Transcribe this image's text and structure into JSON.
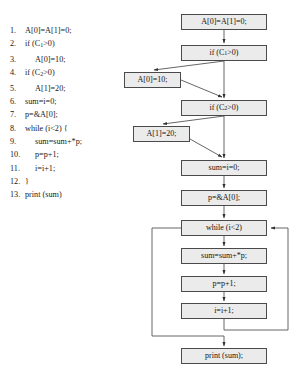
{
  "code_listing": {
    "name": "source-code-listing",
    "lines": [
      {
        "num": "1.",
        "indent": 0,
        "text": "A[0]=A[1]=0;"
      },
      {
        "num": "2.",
        "indent": 0,
        "text": "if (C",
        "sub": "1",
        "text_after": ">0)"
      },
      {
        "num": "3.",
        "indent": 1,
        "text": "A[0]=10;"
      },
      {
        "num": "4.",
        "indent": 0,
        "text": "if (C",
        "sub": "2",
        "text_after": ">0)"
      },
      {
        "num": "5.",
        "indent": 1,
        "text": "A[1]=20;"
      },
      {
        "num": "6.",
        "indent": 0,
        "text": "sum=i=0;"
      },
      {
        "num": "7.",
        "indent": 0,
        "text": "p=&A[0];"
      },
      {
        "num": "8.",
        "indent": 0,
        "text": "while (i<2) {"
      },
      {
        "num": "9.",
        "indent": 1,
        "text": "sum=sum+*p;"
      },
      {
        "num": "10.",
        "indent": 1,
        "text": "p=p+1;"
      },
      {
        "num": "11.",
        "indent": 1,
        "text": "i=i+1;"
      },
      {
        "num": "12.",
        "indent": 0,
        "text": "}"
      },
      {
        "num": "13.",
        "indent": 0,
        "text": "print (sum)"
      }
    ]
  },
  "flow_graph": {
    "name": "control-flow-graph",
    "nodes": [
      {
        "id": "init",
        "label": "A[0]=A[1]=0;",
        "x": 181,
        "y": 14,
        "w": 86,
        "h": 16
      },
      {
        "id": "if_c1",
        "label": "if (C",
        "sub": "1",
        "label_after": ">0)",
        "x": 181,
        "y": 45,
        "w": 86,
        "h": 16
      },
      {
        "id": "a0_10",
        "label": "A[0]=10;",
        "x": 124,
        "y": 72,
        "w": 57,
        "h": 16
      },
      {
        "id": "if_c2",
        "label": "if (C",
        "sub": "2",
        "label_after": ">0)",
        "x": 181,
        "y": 100,
        "w": 86,
        "h": 16
      },
      {
        "id": "a1_20",
        "label": "A[1]=20;",
        "x": 133,
        "y": 126,
        "w": 57,
        "h": 16
      },
      {
        "id": "sum_i_0",
        "label": "sum=i=0;",
        "x": 181,
        "y": 160,
        "w": 86,
        "h": 16
      },
      {
        "id": "p_addr",
        "label": "p=&A[0];",
        "x": 181,
        "y": 190,
        "w": 86,
        "h": 16
      },
      {
        "id": "while_i2",
        "label": "while (i<2)",
        "x": 181,
        "y": 220,
        "w": 86,
        "h": 16
      },
      {
        "id": "sum_add",
        "label": "sum=sum+*p;",
        "x": 181,
        "y": 248,
        "w": 86,
        "h": 16
      },
      {
        "id": "p_inc",
        "label": "p=p+1;",
        "x": 181,
        "y": 276,
        "w": 86,
        "h": 16
      },
      {
        "id": "i_inc",
        "label": "i=i+1;",
        "x": 181,
        "y": 303,
        "w": 86,
        "h": 16
      },
      {
        "id": "print",
        "label": "print (sum);",
        "x": 181,
        "y": 348,
        "w": 86,
        "h": 16
      }
    ],
    "edges": [
      {
        "from": "init",
        "to": "if_c1",
        "kind": "straight-down"
      },
      {
        "from": "if_c1",
        "to": "a0_10",
        "kind": "branch-left"
      },
      {
        "from": "if_c1",
        "to": "if_c2",
        "kind": "straight-down"
      },
      {
        "from": "a0_10",
        "to": "if_c2",
        "kind": "merge-right"
      },
      {
        "from": "if_c2",
        "to": "a1_20",
        "kind": "branch-left"
      },
      {
        "from": "if_c2",
        "to": "sum_i_0",
        "kind": "straight-down"
      },
      {
        "from": "a1_20",
        "to": "sum_i_0",
        "kind": "merge-right"
      },
      {
        "from": "sum_i_0",
        "to": "p_addr",
        "kind": "straight-down"
      },
      {
        "from": "p_addr",
        "to": "while_i2",
        "kind": "straight-down"
      },
      {
        "from": "while_i2",
        "to": "sum_add",
        "kind": "straight-down"
      },
      {
        "from": "sum_add",
        "to": "p_inc",
        "kind": "straight-down"
      },
      {
        "from": "p_inc",
        "to": "i_inc",
        "kind": "straight-down"
      },
      {
        "from": "i_inc",
        "to": "while_i2",
        "kind": "loop-back-right"
      },
      {
        "from": "while_i2",
        "to": "print",
        "kind": "exit-left"
      }
    ]
  }
}
